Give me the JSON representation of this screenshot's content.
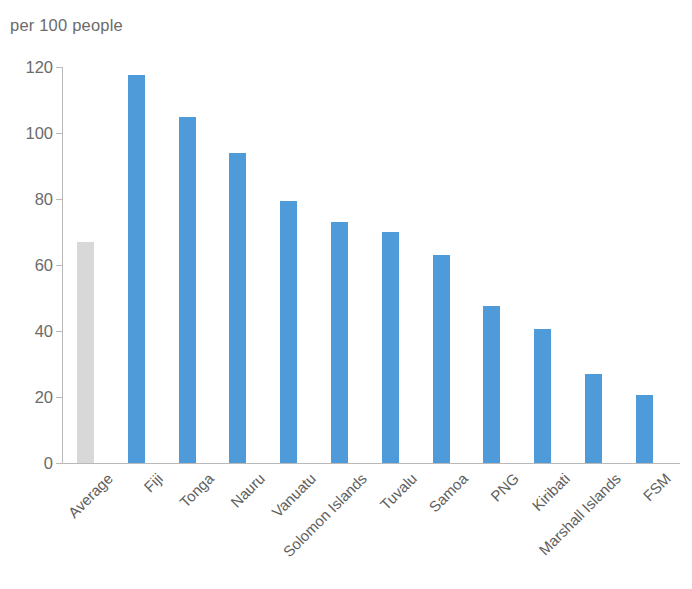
{
  "chart_data": {
    "type": "bar",
    "title": "per 100 people",
    "subtitle": "",
    "xlabel": "",
    "ylabel": "",
    "ylim": [
      0,
      120
    ],
    "yticks": [
      0,
      20,
      40,
      60,
      80,
      100,
      120
    ],
    "ytick_labels": [
      "0",
      "20",
      "40",
      "60",
      "80",
      "100",
      "120"
    ],
    "grid": false,
    "legend": "none",
    "categories": [
      "Average",
      "Fiji",
      "Tonga",
      "Nauru",
      "Vanuatu",
      "Solomon Islands",
      "Tuvalu",
      "Samoa",
      "PNG",
      "Kiribati",
      "Marshall Islands",
      "FSM"
    ],
    "values": [
      67,
      117.5,
      105,
      94,
      79.5,
      73,
      70,
      63,
      47.5,
      40.5,
      27,
      20.5
    ],
    "bar_colors": [
      "#d8d8d8",
      "#4f9bd9",
      "#4f9bd9",
      "#4f9bd9",
      "#4f9bd9",
      "#4f9bd9",
      "#4f9bd9",
      "#4f9bd9",
      "#4f9bd9",
      "#4f9bd9",
      "#4f9bd9",
      "#4f9bd9"
    ],
    "series": [
      {
        "name": "per 100 people",
        "values": [
          67,
          117.5,
          105,
          94,
          79.5,
          73,
          70,
          63,
          47.5,
          40.5,
          27,
          20.5
        ]
      }
    ],
    "colors": {
      "bar_primary": "#4f9bd9",
      "bar_average": "#d8d8d8",
      "axis": "#b9b9b9",
      "text": "#6b6b6b",
      "background": "#ffffff"
    }
  }
}
